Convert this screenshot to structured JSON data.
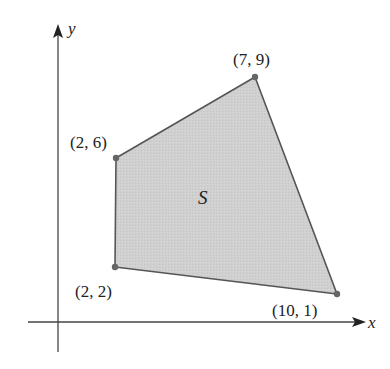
{
  "figure": {
    "axes": {
      "x_label": "x",
      "y_label": "y"
    },
    "region": {
      "label": "S",
      "fill": "#cfcfcf",
      "stroke": "#555555",
      "vertices": [
        {
          "label": "(2, 6)",
          "x": 2,
          "y": 6
        },
        {
          "label": "(7, 9)",
          "x": 7,
          "y": 9
        },
        {
          "label": "(10, 1)",
          "x": 10,
          "y": 1
        },
        {
          "label": "(2, 2)",
          "x": 2,
          "y": 2
        }
      ]
    }
  }
}
